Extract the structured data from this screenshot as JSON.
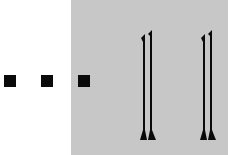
{
  "image": {
    "description": "Three black square dots followed by two tall stylized double-stroke glyphs on a gray panel",
    "dots_count": 3,
    "glyphs_count": 2,
    "colors": {
      "background": "#ffffff",
      "panel": "#c7c7c7",
      "ink": "#0a0a0a"
    }
  }
}
